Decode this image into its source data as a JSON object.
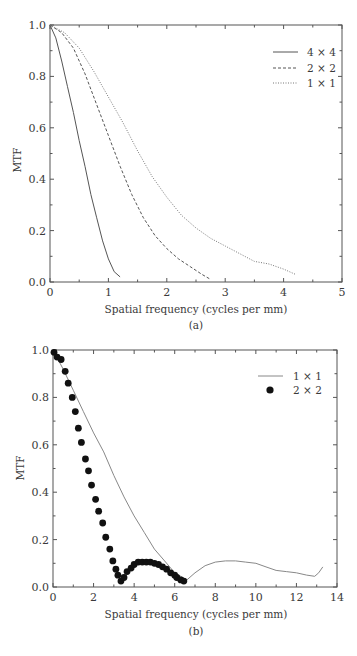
{
  "chart_data": [
    {
      "type": "line",
      "panel": "(a)",
      "title": "",
      "xlabel": "Spatial frequency (cycles per mm)",
      "ylabel": "MTF",
      "xlim": [
        0,
        5
      ],
      "ylim": [
        0,
        1.0
      ],
      "xticks": [
        "0",
        "1",
        "2",
        "3",
        "4",
        "5"
      ],
      "yticks": [
        "0.0",
        "0.2",
        "0.4",
        "0.6",
        "0.8",
        "1.0"
      ],
      "grid": false,
      "legend_position": "upper right",
      "series": [
        {
          "name": "4 × 4",
          "style": "solid",
          "x": [
            0,
            0.1,
            0.2,
            0.3,
            0.4,
            0.5,
            0.6,
            0.7,
            0.8,
            0.9,
            1.0,
            1.1,
            1.2
          ],
          "y": [
            1.0,
            0.95,
            0.86,
            0.76,
            0.66,
            0.55,
            0.45,
            0.34,
            0.25,
            0.16,
            0.09,
            0.04,
            0.02
          ]
        },
        {
          "name": "2 × 2",
          "style": "dashed",
          "x": [
            0,
            0.2,
            0.4,
            0.6,
            0.8,
            1.0,
            1.2,
            1.4,
            1.6,
            1.8,
            2.0,
            2.2,
            2.4,
            2.6,
            2.75
          ],
          "y": [
            1.0,
            0.97,
            0.91,
            0.81,
            0.69,
            0.57,
            0.45,
            0.34,
            0.25,
            0.18,
            0.13,
            0.09,
            0.06,
            0.03,
            0.01
          ]
        },
        {
          "name": "1 × 1",
          "style": "dotted",
          "x": [
            0,
            0.25,
            0.5,
            0.75,
            1.0,
            1.25,
            1.5,
            1.75,
            2.0,
            2.25,
            2.5,
            2.75,
            3.0,
            3.25,
            3.5,
            3.75,
            4.0,
            4.2
          ],
          "y": [
            1.0,
            0.97,
            0.91,
            0.82,
            0.72,
            0.62,
            0.51,
            0.41,
            0.33,
            0.26,
            0.21,
            0.17,
            0.14,
            0.11,
            0.08,
            0.07,
            0.05,
            0.03
          ]
        }
      ]
    },
    {
      "type": "line",
      "panel": "(b)",
      "title": "",
      "xlabel": "Spatial frequency (cycles per mm)",
      "ylabel": "MTF",
      "xlim": [
        0,
        14
      ],
      "ylim": [
        0,
        1.0
      ],
      "xticks": [
        "0",
        "2",
        "4",
        "6",
        "8",
        "10",
        "12",
        "14"
      ],
      "yticks": [
        "0.0",
        "0.2",
        "0.4",
        "0.6",
        "0.8",
        "1.0"
      ],
      "grid": false,
      "legend_position": "upper right",
      "series": [
        {
          "name": "1 × 1",
          "style": "solid",
          "x": [
            0,
            0.5,
            1.0,
            1.5,
            2.0,
            2.5,
            3.0,
            3.5,
            4.0,
            4.5,
            5.0,
            5.5,
            6.0,
            6.6,
            7.0,
            7.5,
            8.0,
            8.5,
            9.0,
            9.5,
            10.0,
            10.5,
            11.0,
            11.5,
            12.0,
            12.5,
            12.9,
            13.1,
            13.3
          ],
          "y": [
            1.0,
            0.92,
            0.83,
            0.74,
            0.65,
            0.57,
            0.47,
            0.38,
            0.3,
            0.23,
            0.16,
            0.11,
            0.06,
            0.03,
            0.06,
            0.09,
            0.105,
            0.11,
            0.11,
            0.105,
            0.1,
            0.085,
            0.07,
            0.065,
            0.06,
            0.05,
            0.045,
            0.06,
            0.085
          ]
        },
        {
          "name": "2 × 2",
          "style": "markers",
          "x": [
            0.05,
            0.2,
            0.4,
            0.6,
            0.75,
            0.95,
            1.1,
            1.25,
            1.4,
            1.6,
            1.75,
            1.9,
            2.1,
            2.25,
            2.45,
            2.6,
            2.8,
            2.95,
            3.1,
            3.2,
            3.35,
            3.5,
            3.65,
            3.85,
            4.0,
            4.2,
            4.4,
            4.6,
            4.8,
            5.0,
            5.2,
            5.4,
            5.6,
            5.8,
            6.0,
            6.1,
            6.3,
            6.45
          ],
          "y": [
            0.99,
            0.97,
            0.96,
            0.91,
            0.86,
            0.8,
            0.74,
            0.67,
            0.61,
            0.54,
            0.49,
            0.43,
            0.37,
            0.32,
            0.27,
            0.21,
            0.16,
            0.11,
            0.075,
            0.05,
            0.025,
            0.04,
            0.065,
            0.08,
            0.095,
            0.105,
            0.105,
            0.105,
            0.105,
            0.1,
            0.095,
            0.085,
            0.075,
            0.06,
            0.05,
            0.04,
            0.03,
            0.025
          ]
        }
      ]
    }
  ],
  "panels": {
    "a": {
      "ylabel": "MTF",
      "xlabel": "Spatial frequency (cycles per mm)",
      "caption": "(a)",
      "legend": [
        "4 × 4",
        "2 × 2",
        "1 × 1"
      ]
    },
    "b": {
      "ylabel": "MTF",
      "xlabel": "Spatial frequency (cycles per mm)",
      "caption": "(b)",
      "legend": [
        "1 × 1",
        "2 × 2"
      ]
    }
  }
}
